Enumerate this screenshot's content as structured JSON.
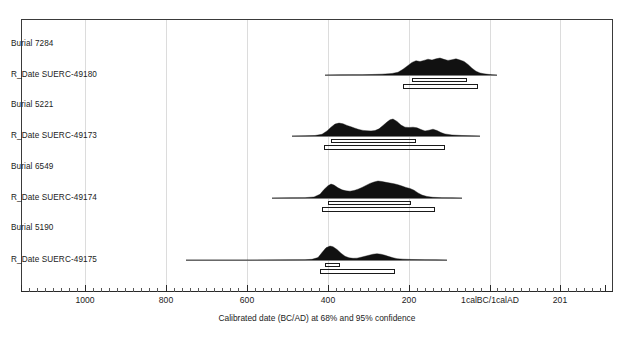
{
  "figure": {
    "xlabel": "Calibrated date (BC/AD) at 68% and 95% confidence",
    "plot_frame": {
      "x": 21,
      "y": 19,
      "width": 592,
      "height": 273
    },
    "background_color": "#ffffff",
    "frame_color": "#3a3a3a",
    "grid_color": "#dcdcdc",
    "distribution_color": "#111111"
  },
  "axis": {
    "orientation": "horizontal",
    "grid": true,
    "major_ticks": [
      {
        "label": "1000",
        "x": 85
      },
      {
        "label": "800",
        "x": 166
      },
      {
        "label": "600",
        "x": 247
      },
      {
        "label": "400",
        "x": 328
      },
      {
        "label": "200",
        "x": 409
      },
      {
        "label": "1calBC/1calAD",
        "x": 490
      },
      {
        "label": "201",
        "x": 560
      }
    ],
    "minor_tick_xs": [
      29,
      37,
      45,
      53,
      61,
      69,
      77,
      93,
      101,
      109,
      117,
      125,
      133,
      141,
      149,
      157,
      174,
      182,
      190,
      198,
      206,
      214,
      222,
      230,
      238,
      255,
      263,
      271,
      279,
      287,
      295,
      303,
      311,
      319,
      336,
      344,
      352,
      360,
      368,
      376,
      384,
      392,
      400,
      417,
      425,
      433,
      441,
      449,
      457,
      465,
      473,
      481,
      497,
      505,
      513,
      521,
      529,
      537,
      545,
      553,
      568,
      576,
      584,
      592,
      600
    ],
    "gridline_xs": [
      85,
      166,
      247,
      328,
      409,
      490,
      560
    ]
  },
  "rows": [
    {
      "label": "Burial 7284",
      "y": 44,
      "type": "group"
    },
    {
      "label": "R_Date SUERC-49180",
      "y": 75,
      "type": "date"
    },
    {
      "label": "Burial 5221",
      "y": 105,
      "type": "group"
    },
    {
      "label": "R_Date SUERC-49173",
      "y": 136,
      "type": "date"
    },
    {
      "label": "Burial 6549",
      "y": 167,
      "type": "group"
    },
    {
      "label": "R_Date SUERC-49174",
      "y": 198,
      "type": "date"
    },
    {
      "label": "Burial 5190",
      "y": 228,
      "type": "group"
    },
    {
      "label": "R_Date SUERC-49175",
      "y": 260,
      "type": "date"
    }
  ],
  "chart_data": {
    "type": "area",
    "title": "",
    "xlabel": "Calibrated date (BC/AD) at 68% and 95% confidence",
    "ylabel": "",
    "xlim_labels": [
      "1000",
      "201"
    ],
    "series": [
      {
        "name": "R_Date SUERC-49180",
        "group": "Burial 7284",
        "baseline_y": 75,
        "baseline_x_start": 325,
        "baseline_x_end": 497,
        "conf_68": {
          "x_start": 412,
          "x_end": 467
        },
        "conf_95": {
          "x_start": 403,
          "x_end": 478
        },
        "profile": [
          [
            325,
            0.0
          ],
          [
            340,
            0.01
          ],
          [
            352,
            0.02
          ],
          [
            362,
            0.02
          ],
          [
            372,
            0.03
          ],
          [
            382,
            0.05
          ],
          [
            392,
            0.09
          ],
          [
            398,
            0.16
          ],
          [
            403,
            0.34
          ],
          [
            408,
            0.56
          ],
          [
            412,
            0.74
          ],
          [
            416,
            0.84
          ],
          [
            420,
            0.79
          ],
          [
            424,
            0.86
          ],
          [
            428,
            0.93
          ],
          [
            432,
            0.88
          ],
          [
            436,
            0.95
          ],
          [
            440,
            1.0
          ],
          [
            444,
            0.92
          ],
          [
            448,
            0.86
          ],
          [
            452,
            0.9
          ],
          [
            456,
            0.95
          ],
          [
            460,
            0.88
          ],
          [
            464,
            0.8
          ],
          [
            468,
            0.62
          ],
          [
            472,
            0.4
          ],
          [
            476,
            0.22
          ],
          [
            480,
            0.12
          ],
          [
            484,
            0.07
          ],
          [
            488,
            0.04
          ],
          [
            492,
            0.02
          ],
          [
            497,
            0.0
          ]
        ]
      },
      {
        "name": "R_Date SUERC-49173",
        "group": "Burial 5221",
        "baseline_y": 136,
        "baseline_x_start": 292,
        "baseline_x_end": 480,
        "conf_68": {
          "x_start": 331,
          "x_end": 416
        },
        "conf_95": {
          "x_start": 324,
          "x_end": 445
        },
        "profile": [
          [
            292,
            0.0
          ],
          [
            305,
            0.01
          ],
          [
            315,
            0.03
          ],
          [
            322,
            0.1
          ],
          [
            327,
            0.3
          ],
          [
            331,
            0.52
          ],
          [
            335,
            0.7
          ],
          [
            339,
            0.76
          ],
          [
            343,
            0.72
          ],
          [
            347,
            0.62
          ],
          [
            351,
            0.54
          ],
          [
            355,
            0.46
          ],
          [
            359,
            0.38
          ],
          [
            363,
            0.33
          ],
          [
            367,
            0.31
          ],
          [
            371,
            0.3
          ],
          [
            375,
            0.32
          ],
          [
            379,
            0.42
          ],
          [
            383,
            0.62
          ],
          [
            387,
            0.82
          ],
          [
            390,
            0.95
          ],
          [
            393,
            1.0
          ],
          [
            397,
            0.86
          ],
          [
            401,
            0.64
          ],
          [
            405,
            0.52
          ],
          [
            409,
            0.5
          ],
          [
            413,
            0.52
          ],
          [
            417,
            0.48
          ],
          [
            421,
            0.38
          ],
          [
            425,
            0.3
          ],
          [
            429,
            0.34
          ],
          [
            433,
            0.4
          ],
          [
            437,
            0.32
          ],
          [
            441,
            0.2
          ],
          [
            445,
            0.12
          ],
          [
            452,
            0.06
          ],
          [
            462,
            0.03
          ],
          [
            472,
            0.01
          ],
          [
            480,
            0.0
          ]
        ]
      },
      {
        "name": "R_Date SUERC-49174",
        "group": "Burial 6549",
        "baseline_y": 198,
        "baseline_x_start": 272,
        "baseline_x_end": 462,
        "conf_68": {
          "x_start": 328,
          "x_end": 411
        },
        "conf_95": {
          "x_start": 322,
          "x_end": 435
        },
        "profile": [
          [
            272,
            0.0
          ],
          [
            290,
            0.01
          ],
          [
            305,
            0.02
          ],
          [
            314,
            0.06
          ],
          [
            320,
            0.22
          ],
          [
            324,
            0.5
          ],
          [
            328,
            0.72
          ],
          [
            331,
            0.82
          ],
          [
            334,
            0.76
          ],
          [
            338,
            0.6
          ],
          [
            342,
            0.48
          ],
          [
            346,
            0.42
          ],
          [
            350,
            0.4
          ],
          [
            354,
            0.44
          ],
          [
            358,
            0.52
          ],
          [
            362,
            0.62
          ],
          [
            366,
            0.74
          ],
          [
            370,
            0.86
          ],
          [
            374,
            0.94
          ],
          [
            378,
            1.0
          ],
          [
            382,
            0.97
          ],
          [
            386,
            0.92
          ],
          [
            390,
            0.88
          ],
          [
            394,
            0.84
          ],
          [
            398,
            0.78
          ],
          [
            402,
            0.7
          ],
          [
            406,
            0.62
          ],
          [
            410,
            0.56
          ],
          [
            414,
            0.46
          ],
          [
            418,
            0.3
          ],
          [
            422,
            0.17
          ],
          [
            427,
            0.09
          ],
          [
            433,
            0.04
          ],
          [
            442,
            0.02
          ],
          [
            452,
            0.01
          ],
          [
            462,
            0.0
          ]
        ]
      },
      {
        "name": "R_Date SUERC-49175",
        "group": "Burial 5190",
        "baseline_y": 260,
        "baseline_x_start": 186,
        "baseline_x_end": 447,
        "conf_68": {
          "x_start": 325,
          "x_end": 340
        },
        "conf_95": {
          "x_start": 320,
          "x_end": 395
        },
        "profile": [
          [
            186,
            0.0
          ],
          [
            250,
            0.0
          ],
          [
            290,
            0.01
          ],
          [
            305,
            0.02
          ],
          [
            312,
            0.04
          ],
          [
            318,
            0.14
          ],
          [
            322,
            0.44
          ],
          [
            326,
            0.72
          ],
          [
            330,
            0.82
          ],
          [
            333,
            0.78
          ],
          [
            337,
            0.62
          ],
          [
            341,
            0.4
          ],
          [
            345,
            0.22
          ],
          [
            349,
            0.13
          ],
          [
            353,
            0.1
          ],
          [
            357,
            0.11
          ],
          [
            361,
            0.16
          ],
          [
            365,
            0.22
          ],
          [
            369,
            0.28
          ],
          [
            373,
            0.34
          ],
          [
            377,
            0.37
          ],
          [
            381,
            0.34
          ],
          [
            385,
            0.28
          ],
          [
            389,
            0.2
          ],
          [
            393,
            0.13
          ],
          [
            397,
            0.08
          ],
          [
            403,
            0.05
          ],
          [
            412,
            0.03
          ],
          [
            425,
            0.02
          ],
          [
            436,
            0.01
          ],
          [
            447,
            0.0
          ]
        ]
      }
    ]
  }
}
